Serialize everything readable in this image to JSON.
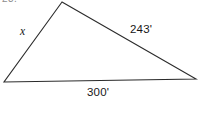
{
  "figure": {
    "background_color": "#ffffff",
    "stroke_color": "#2b2b2b",
    "item_number_fragment": "23.",
    "labels": {
      "left_side": "x",
      "right_side": "243'",
      "base_side": "300'"
    }
  },
  "chart_data": {
    "type": "diagram",
    "shape": "triangle",
    "title": "",
    "vertices": [
      {
        "name": "apex",
        "x": 62,
        "y": 2
      },
      {
        "name": "left",
        "x": 4,
        "y": 82
      },
      {
        "name": "right",
        "x": 196,
        "y": 79
      }
    ],
    "sides": [
      {
        "name": "left_side",
        "from": "apex",
        "to": "left",
        "label": "x",
        "value": null,
        "unit": "ft",
        "known": false
      },
      {
        "name": "right_side",
        "from": "apex",
        "to": "right",
        "label": "243'",
        "value": 243,
        "unit": "ft",
        "known": true
      },
      {
        "name": "base_side",
        "from": "left",
        "to": "right",
        "label": "300'",
        "value": 300,
        "unit": "ft",
        "known": true
      }
    ],
    "grid": false,
    "legend": false
  }
}
